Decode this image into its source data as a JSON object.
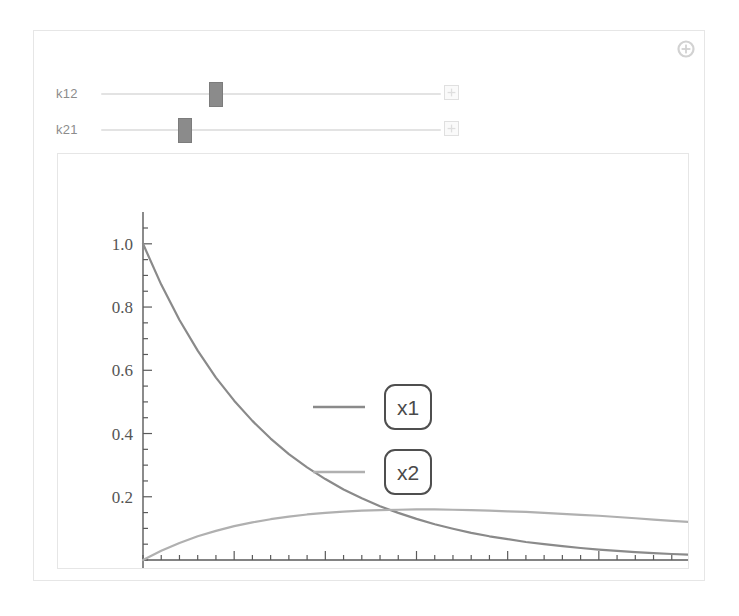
{
  "panel": {
    "plus_button_icon": "circled-plus-icon"
  },
  "controls": [
    {
      "label": "k12",
      "handle_fraction": 0.33,
      "stepper_icon": "stepper-plus-icon"
    },
    {
      "label": "k21",
      "handle_fraction": 0.235,
      "stepper_icon": "stepper-plus-icon"
    }
  ],
  "colors": {
    "x1": "#8a8a8a",
    "x2": "#b0b0b0",
    "axis": "#5a5a5a",
    "frame": "#e6e6e6",
    "legend_box_border": "#4f4f4f",
    "legend_text": "#3f3f3f",
    "slider_handle": "#8b8b8b",
    "slider_track": "#e3e3e3",
    "label_text": "#8c8c8c"
  },
  "chart_data": {
    "type": "line",
    "title": "",
    "xlabel": "",
    "ylabel": "",
    "xlim": [
      0,
      30
    ],
    "ylim": [
      0,
      1.05
    ],
    "xticks": [
      5,
      10,
      15,
      20,
      25,
      30
    ],
    "xticklabels": [
      "5",
      "10",
      "15",
      "20",
      "25",
      "30"
    ],
    "yticks": [
      0.2,
      0.4,
      0.6,
      0.8,
      1.0
    ],
    "yticklabels": [
      "0.2",
      "0.4",
      "0.6",
      "0.8",
      "1.0"
    ],
    "xminor_step": 1,
    "yminor_step": 0.05,
    "grid": false,
    "legend_position": "center",
    "legend": [
      "x1",
      "x2"
    ],
    "x": [
      0,
      1,
      2,
      3,
      4,
      5,
      6,
      7,
      8,
      9,
      10,
      11,
      12,
      13,
      14,
      15,
      16,
      17,
      18,
      19,
      20,
      21,
      22,
      23,
      24,
      25,
      26,
      27,
      28,
      29,
      30
    ],
    "series": [
      {
        "name": "x1",
        "values": [
          1.0,
          0.871,
          0.759,
          0.662,
          0.577,
          0.504,
          0.44,
          0.384,
          0.335,
          0.293,
          0.256,
          0.223,
          0.195,
          0.17,
          0.149,
          0.13,
          0.113,
          0.099,
          0.086,
          0.075,
          0.066,
          0.057,
          0.05,
          0.044,
          0.038,
          0.033,
          0.029,
          0.025,
          0.022,
          0.019,
          0.017
        ]
      },
      {
        "name": "x2",
        "values": [
          0.0,
          0.029,
          0.054,
          0.075,
          0.092,
          0.107,
          0.119,
          0.129,
          0.137,
          0.144,
          0.149,
          0.153,
          0.156,
          0.158,
          0.159,
          0.16,
          0.16,
          0.159,
          0.158,
          0.156,
          0.154,
          0.152,
          0.149,
          0.146,
          0.143,
          0.14,
          0.136,
          0.132,
          0.128,
          0.124,
          0.12
        ]
      }
    ]
  }
}
